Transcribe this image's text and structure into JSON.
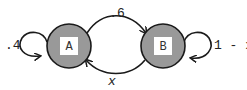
{
  "diagram": {
    "type": "markov-chain",
    "colors": {
      "node_fill": "#999999",
      "node_stroke": "#1a1a1a",
      "label_box": "#ffffff",
      "edge": "#1a1a1a"
    },
    "nodes": [
      {
        "id": "A",
        "label": "A"
      },
      {
        "id": "B",
        "label": "B"
      }
    ],
    "edges": [
      {
        "from": "A",
        "to": "A",
        "label": ".4"
      },
      {
        "from": "A",
        "to": "B",
        "label": ".6"
      },
      {
        "from": "B",
        "to": "A",
        "label": "x"
      },
      {
        "from": "B",
        "to": "B",
        "label": "1 - x"
      }
    ]
  }
}
